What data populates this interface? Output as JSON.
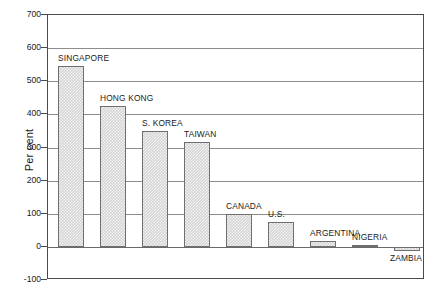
{
  "chart_data": {
    "type": "bar",
    "title": "",
    "subtitle": "",
    "xlabel": "",
    "ylabel": "Per cent",
    "ylim": [
      -100,
      700
    ],
    "ytick_step": 100,
    "yticks": [
      700,
      600,
      500,
      400,
      300,
      200,
      100,
      0,
      -100
    ],
    "ytick_labels": [
      "700",
      "600",
      "500",
      "400",
      "300",
      "200",
      "100",
      "0",
      "-100"
    ],
    "grid": true,
    "grid_axis": "y",
    "legend": false,
    "legend_position": "none",
    "categories": [
      "SINGAPORE",
      "HONG KONG",
      "S. KOREA",
      "TAIWAN",
      "CANADA",
      "U.S.",
      "ARGENTINA",
      "NIGERIA",
      "ZAMBIA"
    ],
    "values": [
      545,
      425,
      350,
      318,
      100,
      75,
      18,
      6,
      -12
    ],
    "bar_color": "#d4d4d4",
    "bar_edge_color": "#6f6f6f",
    "bar_fill_pattern": "fine-checker",
    "label_placement": "above-bar-left-aligned",
    "zambia_label_placement": "below-bar",
    "axis_color": "#4a4a4a",
    "gridline_color": "#8d8d8d",
    "background_color": "#ffffff"
  },
  "axis": {
    "y_title": "Per cent"
  }
}
